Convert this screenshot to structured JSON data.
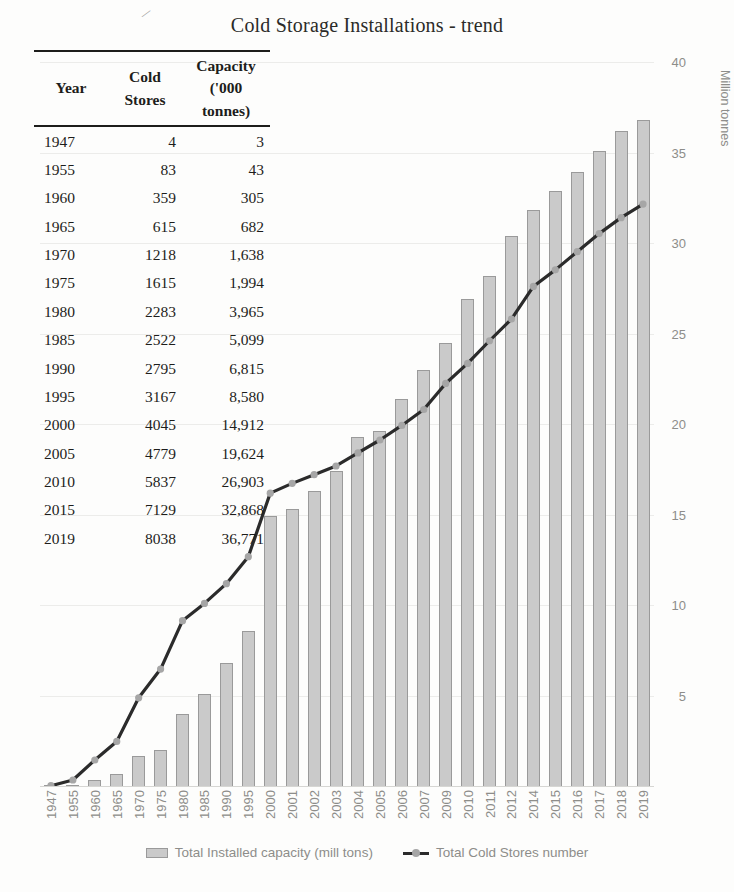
{
  "chart": {
    "title": "Cold Storage Installations - trend",
    "y_axis_title": "Million tonnes",
    "y_ticks": [
      "40",
      "35",
      "30",
      "25",
      "20",
      "15",
      "10",
      "5"
    ],
    "legend": [
      {
        "label": "Total Installed capacity (mill tons)",
        "marker": "bar-swatch"
      },
      {
        "label": "Total Cold Stores number",
        "marker": "line-swatch"
      }
    ]
  },
  "table": {
    "headers": [
      "Year",
      "Cold Stores",
      "Capacity ('000 tonnes)"
    ],
    "header_lines": {
      "year": "Year",
      "stores_1": "Cold",
      "stores_2": "Stores",
      "cap_1": "Capacity",
      "cap_2": "('000",
      "cap_3": "tonnes)"
    },
    "rows": [
      {
        "year": "1947",
        "stores": "4",
        "capacity": "3"
      },
      {
        "year": "1955",
        "stores": "83",
        "capacity": "43"
      },
      {
        "year": "1960",
        "stores": "359",
        "capacity": "305"
      },
      {
        "year": "1965",
        "stores": "615",
        "capacity": "682"
      },
      {
        "year": "1970",
        "stores": "1218",
        "capacity": "1,638"
      },
      {
        "year": "1975",
        "stores": "1615",
        "capacity": "1,994"
      },
      {
        "year": "1980",
        "stores": "2283",
        "capacity": "3,965"
      },
      {
        "year": "1985",
        "stores": "2522",
        "capacity": "5,099"
      },
      {
        "year": "1990",
        "stores": "2795",
        "capacity": "6,815"
      },
      {
        "year": "1995",
        "stores": "3167",
        "capacity": "8,580"
      },
      {
        "year": "2000",
        "stores": "4045",
        "capacity": "14,912"
      },
      {
        "year": "2005",
        "stores": "4779",
        "capacity": "19,624"
      },
      {
        "year": "2010",
        "stores": "5837",
        "capacity": "26,903"
      },
      {
        "year": "2015",
        "stores": "7129",
        "capacity": "32,868"
      },
      {
        "year": "2019",
        "stores": "8038",
        "capacity": "36,771"
      }
    ]
  },
  "chart_data": {
    "type": "bar",
    "title": "Cold Storage Installations - trend",
    "xlabel": "",
    "ylabel": "Million tonnes",
    "ylim": [
      0,
      40
    ],
    "ytick_step": 5,
    "grid": true,
    "legend_position": "bottom",
    "categories": [
      "1947",
      "1955",
      "1960",
      "1965",
      "1970",
      "1975",
      "1980",
      "1985",
      "1990",
      "1995",
      "2000",
      "2001",
      "2002",
      "2003",
      "2004",
      "2005",
      "2006",
      "2007",
      "2009",
      "2010",
      "2011",
      "2012",
      "2014",
      "2015",
      "2016",
      "2017",
      "2018",
      "2019"
    ],
    "series": [
      {
        "name": "Total Installed capacity (mill tons)",
        "type": "bar",
        "axis": "right",
        "unit": "million tonnes",
        "values": [
          0.003,
          0.043,
          0.305,
          0.682,
          1.638,
          1.994,
          3.965,
          5.099,
          6.815,
          8.58,
          14.912,
          15.3,
          16.3,
          17.4,
          19.3,
          19.624,
          21.4,
          23.0,
          24.5,
          26.903,
          28.2,
          30.4,
          31.8,
          32.868,
          33.9,
          35.1,
          36.2,
          36.771
        ]
      },
      {
        "name": "Total Cold Stores number",
        "type": "line",
        "axis": "left-implicit",
        "unit": "number of cold stores",
        "values": [
          4,
          83,
          359,
          615,
          1218,
          1615,
          2283,
          2522,
          2795,
          3167,
          4045,
          4180,
          4300,
          4420,
          4600,
          4779,
          4980,
          5200,
          5560,
          5837,
          6150,
          6450,
          6900,
          7129,
          7380,
          7630,
          7850,
          8038
        ]
      }
    ]
  },
  "colors": {
    "bar_fill": "#cacaca",
    "bar_border": "#9a9a9a",
    "line": "#2b2b2b",
    "marker": "#a6a6a6",
    "axis_text": "#8d8d8a",
    "grid": "#ececea",
    "table_text": "#1d1d1b",
    "title_text": "#2b2b28"
  }
}
